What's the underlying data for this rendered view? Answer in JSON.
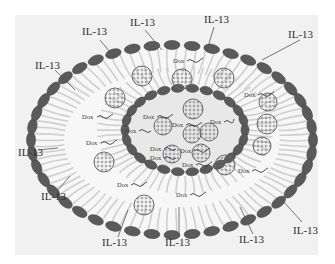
{
  "figure": {
    "colors": {
      "background": "#ffffff",
      "panel": "#f1f1f1",
      "bead": "#5a5a5a",
      "bead_stroke": "#474747",
      "tails": "#cfcfcf",
      "inner_core": "#e6e6e6",
      "text": "#2e2e2e"
    },
    "il13_labels": [
      {
        "text": "IL-13",
        "x": 35,
        "y": 60
      },
      {
        "text": "IL-13",
        "x": 82,
        "y": 26
      },
      {
        "text": "IL-13",
        "x": 130,
        "y": 17
      },
      {
        "text": "IL-13",
        "x": 204,
        "y": 14
      },
      {
        "text": "IL-13",
        "x": 288,
        "y": 29
      },
      {
        "text": "IL-13",
        "x": 18,
        "y": 147
      },
      {
        "text": "IL-13",
        "x": 41,
        "y": 191
      },
      {
        "text": "IL-13",
        "x": 102,
        "y": 237
      },
      {
        "text": "IL-13",
        "x": 165,
        "y": 237
      },
      {
        "text": "IL-13",
        "x": 239,
        "y": 234
      },
      {
        "text": "IL-13",
        "x": 293,
        "y": 225
      }
    ],
    "dox_labels": [
      {
        "text": "Dox",
        "x": 173,
        "y": 58
      },
      {
        "text": "Dox",
        "x": 244,
        "y": 92
      },
      {
        "text": "Dox",
        "x": 82,
        "y": 114
      },
      {
        "text": "Dox",
        "x": 86,
        "y": 140
      },
      {
        "text": "Dox",
        "x": 143,
        "y": 114
      },
      {
        "text": "Dox",
        "x": 172,
        "y": 122
      },
      {
        "text": "Dox",
        "x": 210,
        "y": 119
      },
      {
        "text": "Dox",
        "x": 125,
        "y": 128
      },
      {
        "text": "Dox",
        "x": 150,
        "y": 146
      },
      {
        "text": "Dox",
        "x": 180,
        "y": 148
      },
      {
        "text": "Dox",
        "x": 150,
        "y": 155
      },
      {
        "text": "Dox",
        "x": 182,
        "y": 162
      },
      {
        "text": "Dox",
        "x": 238,
        "y": 168
      },
      {
        "text": "Dox",
        "x": 117,
        "y": 182
      },
      {
        "text": "Dox",
        "x": 176,
        "y": 192
      }
    ]
  }
}
